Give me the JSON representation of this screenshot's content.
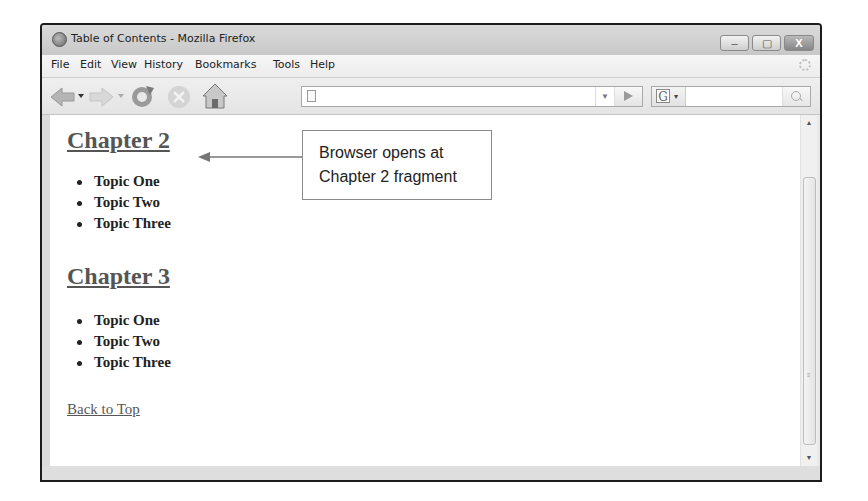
{
  "window": {
    "title": "Table of Contents - Mozilla Firefox",
    "controls": {
      "minimize": "–",
      "maximize": "▢",
      "close": "X"
    }
  },
  "menubar": {
    "items": [
      {
        "label": "File",
        "x": 9
      },
      {
        "label": "Edit",
        "x": 38
      },
      {
        "label": "View",
        "x": 69
      },
      {
        "label": "History",
        "x": 102
      },
      {
        "label": "Bookmarks",
        "x": 153
      },
      {
        "label": "Tools",
        "x": 231
      },
      {
        "label": "Help",
        "x": 268
      }
    ]
  },
  "navbar": {
    "url_value": "",
    "search_value": "",
    "search_engine_letter": "G",
    "url_dropdown_glyph": "▼",
    "engine_dropdown_glyph": "▾"
  },
  "page": {
    "sections": [
      {
        "heading": "Chapter 2",
        "topics": [
          "Topic One",
          "Topic Two",
          "Topic Three"
        ]
      },
      {
        "heading": "Chapter 3",
        "topics": [
          "Topic One",
          "Topic Two",
          "Topic Three"
        ]
      }
    ],
    "back_link": "Back to Top"
  },
  "callout": {
    "line1": "Browser opens at",
    "line2": "Chapter 2 fragment"
  },
  "scrollbar": {
    "up": "▲",
    "down": "▼",
    "grip": "≡"
  },
  "colors": {
    "frame": "#1c1c1c",
    "chrome": "#e9e9e9",
    "heading": "#555555"
  }
}
